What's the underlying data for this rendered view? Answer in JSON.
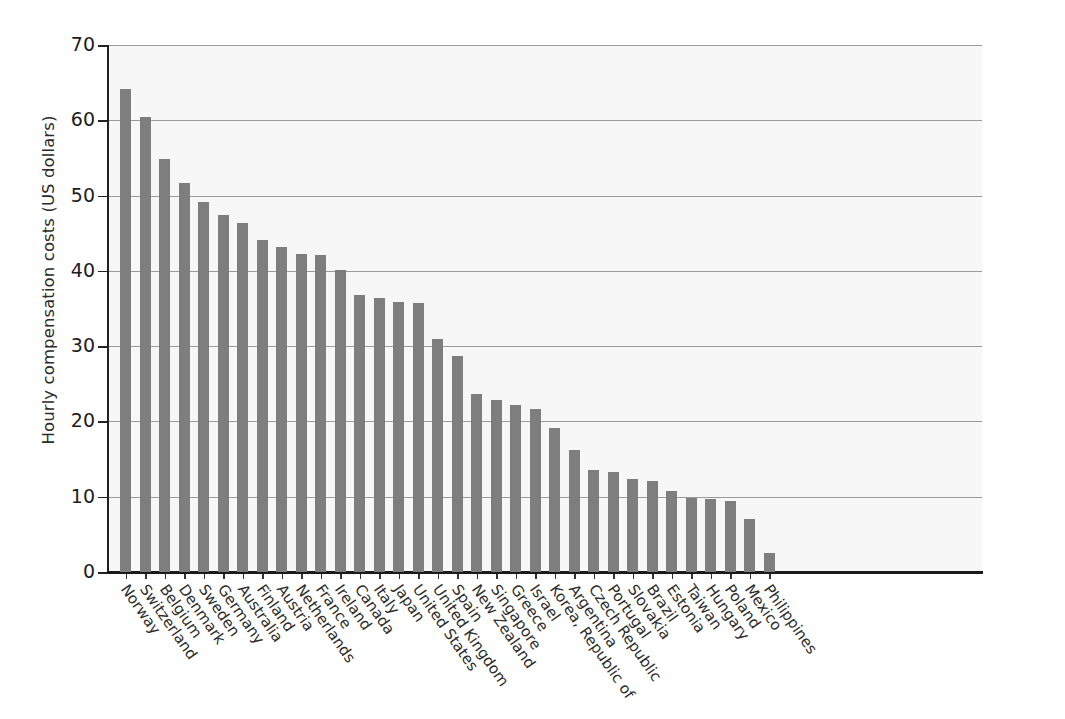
{
  "chart_data": {
    "type": "bar",
    "title": "",
    "xlabel": "",
    "ylabel": "Hourly compensation costs (US dollars)",
    "ylim": [
      0,
      70
    ],
    "yticks": [
      0,
      10,
      20,
      30,
      40,
      50,
      60,
      70
    ],
    "ytick_labels": [
      "0",
      "10",
      "20",
      "30",
      "40",
      "50",
      "60",
      "70"
    ],
    "grid": true,
    "grid_axis": "y",
    "legend": "none",
    "bar_color": "#7e7e7e",
    "plot_background": "#f7f7f7",
    "categories": [
      "Norway",
      "Switzerland",
      "Belgium",
      "Denmark",
      "Sweden",
      "Germany",
      "Australia",
      "Finland",
      "Austria",
      "Netherlands",
      "France",
      "Ireland",
      "Canada",
      "Italy",
      "Japan",
      "United States",
      "United Kingdom",
      "Spain",
      "New Zealand",
      "Singapore",
      "Greece",
      "Israel",
      "Korea, Republic of",
      "Argentina",
      "Czech Republic",
      "Portugal",
      "Slovakia",
      "Brazil",
      "Estonia",
      "Taiwan",
      "Hungary",
      "Poland",
      "Mexico",
      "Philippines"
    ],
    "values": [
      64.2,
      60.4,
      54.8,
      51.7,
      49.1,
      47.4,
      46.3,
      44.1,
      43.2,
      42.3,
      42.1,
      40.1,
      36.8,
      36.4,
      35.9,
      35.7,
      31.0,
      28.7,
      23.7,
      22.9,
      22.2,
      21.7,
      19.1,
      16.2,
      13.6,
      13.3,
      12.3,
      12.1,
      10.8,
      9.8,
      9.7,
      9.4,
      7.0,
      2.5
    ]
  }
}
